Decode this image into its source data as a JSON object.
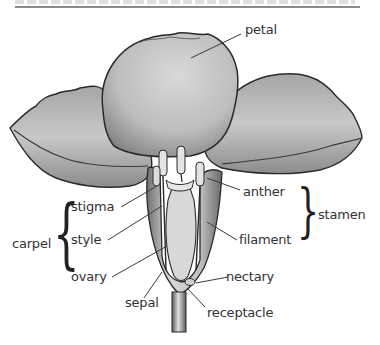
{
  "diagram": {
    "title": "",
    "labels": {
      "petal": "petal",
      "stigma": "stigma",
      "style": "style",
      "ovary": "ovary",
      "carpel": "carpel",
      "anther": "anther",
      "filament": "filament",
      "stamen": "stamen",
      "sepal": "sepal",
      "nectary": "nectary",
      "receptacle": "receptacle"
    },
    "groups": [
      {
        "name": "carpel",
        "members": [
          "stigma",
          "style",
          "ovary"
        ]
      },
      {
        "name": "stamen",
        "members": [
          "anther",
          "filament"
        ]
      }
    ],
    "colors": {
      "outline": "#2a2a2a",
      "petal_fill": "#c9c9c9",
      "petal_shade": "#9a9a9a",
      "label_text": "#333333",
      "leader_line": "#3a3a3a"
    }
  }
}
